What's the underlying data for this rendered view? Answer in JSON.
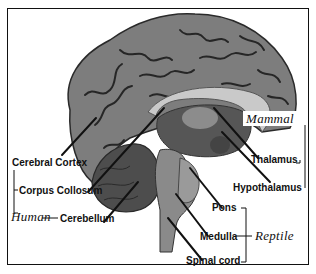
{
  "diagram": {
    "colors": {
      "cortex": "#7d7d7d",
      "cortex_dark": "#3a3a3a",
      "corpus_callosum": "#c9c9c9",
      "cerebellum": "#5a5a5a",
      "brainstem": "#8a8a8a",
      "line": "#111111"
    },
    "labels": {
      "cerebral_cortex": "Cerebral Cortex",
      "corpus_collosum": "Corpus Collosum",
      "cerebellum": "Cerebellum",
      "thalamus": "Thalamus",
      "hypothalamus": "Hypothalamus",
      "pons": "Pons",
      "medulla": "Medulla",
      "spinal_cord": "Spinal cord"
    },
    "groups": {
      "human": "Human",
      "mammal": "Mammal",
      "reptile": "Reptile"
    }
  }
}
